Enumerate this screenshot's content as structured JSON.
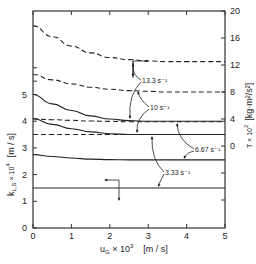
{
  "chart_data": {
    "type": "line",
    "title": "",
    "xlabel": "u_G × 10^3  [m / s]",
    "ylabel_left": "k_L,S × 10^4  [m / s]",
    "ylabel_right": "T × 10^2  [kg·m²/s²]",
    "xlim": [
      0,
      5
    ],
    "ylim_left": [
      0,
      6.5
    ],
    "ylim_right": [
      -12,
      20
    ],
    "x_ticks": [
      "0",
      "1",
      "2",
      "3",
      "4",
      "5"
    ],
    "y_left_ticks": [
      "0",
      "1",
      "2",
      "3",
      "4",
      "5"
    ],
    "y_right_ticks": [
      "0",
      "4",
      "8",
      "12",
      "16",
      "20"
    ],
    "grid": false,
    "legend": "none (inline annotations)",
    "x": [
      0,
      0.5,
      1,
      1.5,
      2,
      2.5,
      3,
      3.5,
      4,
      4.5,
      5
    ],
    "series": [
      {
        "name": "k_L,S 13.3 s^-1",
        "axis": "left",
        "style": "solid",
        "values": [
          5.0,
          4.65,
          4.4,
          4.2,
          4.08,
          4.02,
          4.0,
          4.0,
          4.0,
          4.0,
          4.0
        ]
      },
      {
        "name": "k_L,S 10 s^-1",
        "axis": "left",
        "style": "solid",
        "values": [
          4.1,
          3.88,
          3.72,
          3.6,
          3.53,
          3.5,
          3.5,
          3.5,
          3.5,
          3.5,
          3.5
        ]
      },
      {
        "name": "k_L,S 6.67 s^-1",
        "axis": "left",
        "style": "solid",
        "values": [
          2.75,
          2.68,
          2.62,
          2.58,
          2.56,
          2.55,
          2.55,
          2.55,
          2.55,
          2.55,
          2.55
        ]
      },
      {
        "name": "k_L,S 3.33 s^-1",
        "axis": "left",
        "style": "solid",
        "values": [
          1.5,
          1.5,
          1.5,
          1.5,
          1.5,
          1.5,
          1.5,
          1.5,
          1.5,
          1.5,
          1.5
        ]
      },
      {
        "name": "T 13.3 s^-1",
        "axis": "right",
        "style": "dashed",
        "values": [
          17.8,
          16.2,
          14.8,
          13.8,
          13.1,
          12.8,
          12.6,
          12.5,
          12.5,
          12.5,
          12.5
        ]
      },
      {
        "name": "T 10 s^-1",
        "axis": "right",
        "style": "dashed",
        "values": [
          10.6,
          9.8,
          9.2,
          8.7,
          8.4,
          8.2,
          8.1,
          8.0,
          8.0,
          8.0,
          8.0
        ]
      },
      {
        "name": "T 6.67 s^-1",
        "axis": "right",
        "style": "dashed",
        "values": [
          4.0,
          3.9,
          3.8,
          3.7,
          3.65,
          3.6,
          3.6,
          3.6,
          3.6,
          3.6,
          3.6
        ]
      },
      {
        "name": "T 3.33 s^-1",
        "axis": "right",
        "style": "dashed",
        "values": [
          1.7,
          1.7,
          1.7,
          1.7,
          1.7,
          1.7,
          1.7,
          1.7,
          1.7,
          1.7,
          1.7
        ]
      }
    ],
    "annotations": [
      "13.3 s⁻¹",
      "10 s⁻¹",
      "6.67 s⁻¹",
      "3.33 s⁻¹"
    ],
    "axis_indicators": [
      {
        "meaning": "dashed curves read on right axis",
        "glyph": "arrow-right"
      },
      {
        "meaning": "solid curves read on left axis",
        "glyph": "arrow-left"
      }
    ]
  },
  "labels": {
    "xlabel_main": "u",
    "xlabel_sub": "G",
    "xlabel_tail": " × 10",
    "xlabel_exp": "3",
    "xlabel_unit": "[m / s]",
    "ylabel_left_text": "k",
    "ylabel_left_sub": "L,S",
    "ylabel_left_tail": " × 10",
    "ylabel_left_exp": "4",
    "ylabel_left_unit": "[m / s]",
    "ylabel_right_text": "T × 10",
    "ylabel_right_exp": "2",
    "ylabel_right_unit": "[kg·m²/s²]",
    "ann_13": "13.3 s⁻¹",
    "ann_10": "10 s⁻¹",
    "ann_667": "6.67 s⁻¹",
    "ann_333": "3.33 s⁻¹"
  }
}
